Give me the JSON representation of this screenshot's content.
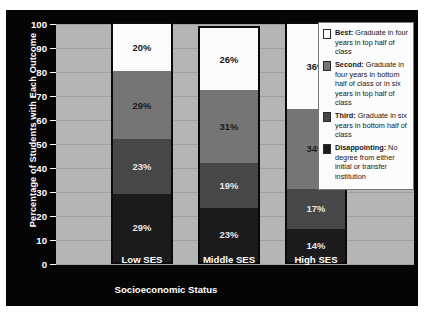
{
  "chart_data": {
    "type": "bar",
    "subtype": "stacked-bar",
    "title": "",
    "xlabel": "Socioeconomic Status",
    "ylabel": "Percentage of Students with Each Outcome",
    "categories": [
      "Low SES",
      "Middle SES",
      "High SES"
    ],
    "ylim": [
      0,
      100
    ],
    "yticks": [
      0,
      10,
      20,
      30,
      40,
      50,
      60,
      70,
      80,
      90,
      100
    ],
    "grid": true,
    "legend_position": "right-inside",
    "stack_order": "bottom-to-top",
    "series": [
      {
        "name": "Disappointing",
        "key": "s3",
        "color": "#1b1b1b",
        "values": [
          29,
          23,
          14
        ],
        "labels": [
          "29%",
          "23%",
          "14%"
        ]
      },
      {
        "name": "Third",
        "key": "s2",
        "color": "#474747",
        "values": [
          23,
          19,
          17
        ],
        "labels": [
          "23%",
          "19%",
          "17%"
        ]
      },
      {
        "name": "Second",
        "key": "s1",
        "color": "#757575",
        "values": [
          29,
          31,
          34
        ],
        "labels": [
          "29%",
          "31%",
          "34%"
        ]
      },
      {
        "name": "Best",
        "key": "s0",
        "color": "#fbfbfb",
        "values": [
          20,
          26,
          36
        ],
        "labels": [
          "20%",
          "26%",
          "36%"
        ]
      }
    ],
    "legend": [
      {
        "name": "Best",
        "color": "#fbfbfb",
        "term": "Best:",
        "desc": " Graduate in four years in top half of class"
      },
      {
        "name": "Second",
        "color": "#757575",
        "term": "Second:",
        "desc": " Graduate in four years in bottom half of class or in six years in top half of class"
      },
      {
        "name": "Third",
        "color": "#474747",
        "term": "Third:",
        "desc": " Graduate in six years in bottom half of class"
      },
      {
        "name": "Disappointing",
        "color": "#1b1b1b",
        "term": "Disappointing:",
        "desc": " No degree from either initial or transfer institution"
      }
    ]
  },
  "colors": {
    "figure_background": "#050505",
    "plot_background": "#b5b5b5",
    "gridline": "#a0a0a0",
    "axis_text": "#ffffff",
    "legend_background": "#fcfcfc"
  }
}
